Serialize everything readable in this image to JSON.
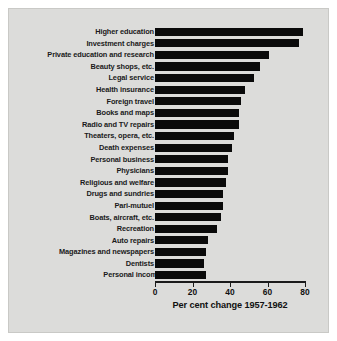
{
  "chart_data": {
    "type": "bar",
    "orientation": "horizontal",
    "title": "",
    "xlabel": "Per cent change 1957-1962",
    "ylabel": "",
    "xlim": [
      0,
      80
    ],
    "xticks": [
      0,
      20,
      40,
      60,
      80
    ],
    "xtick_labels": [
      "0",
      "20",
      "40",
      "60",
      "80"
    ],
    "grid": false,
    "legend": null,
    "bar_color": "#0a0a0a",
    "background_color": "#dcdcda",
    "categories": [
      "Higher education",
      "Investment charges",
      "Private education and research",
      "Beauty shops, etc.",
      "Legal service",
      "Health insurance",
      "Foreign travel",
      "Books and maps",
      "Radio and TV repairs",
      "Theaters, opera, etc.",
      "Death expenses",
      "Personal business",
      "Physicians",
      "Religious and welfare",
      "Drugs and sundries",
      "Pari-mutuel",
      "Boats, aircraft, etc.",
      "Recreation",
      "Auto repairs",
      "Magazines and newspapers",
      "Dentists",
      "Personal income"
    ],
    "values": [
      79,
      77,
      61,
      56,
      53,
      48,
      46,
      45,
      45,
      42,
      41,
      39,
      39,
      38,
      36,
      36,
      35,
      33,
      28,
      27,
      26,
      27
    ],
    "baseline_category": "Personal income"
  },
  "axis": {
    "title": "Per cent change 1957-1962"
  }
}
